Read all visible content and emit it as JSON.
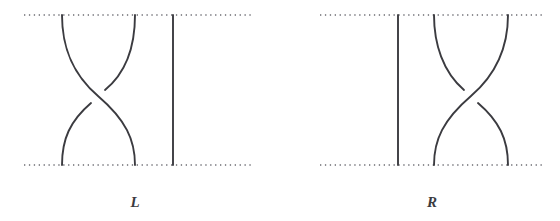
{
  "figure": {
    "kind": "braid-crossing-diagrams",
    "background_color": "#ffffff",
    "stroke_color": "#3b3b40",
    "dotted_line_color": "#6c6c72",
    "panels": [
      {
        "id": "left",
        "label": "L",
        "label_x": 135,
        "label_y": 205,
        "description": "Three-strand braid generator: strands 1 and 2 cross, strand 3 runs straight",
        "boundary_top_y": 15,
        "boundary_bottom_y": 165,
        "boundary_x_start": 24,
        "boundary_x_end": 252,
        "strand_top_anchors": [
          62,
          135,
          173
        ],
        "strand_bottom_anchors": [
          62,
          135,
          173
        ],
        "straight_strand_x": 173,
        "crossing_center_x": 98,
        "crossing_center_y": 96,
        "over_strand": "upper-left-to-lower-right",
        "under_strand": "upper-right-to-lower-left"
      },
      {
        "id": "right",
        "label": "R",
        "label_x": 432,
        "label_y": 205,
        "description": "Three-strand braid generator: strand 1 runs straight, strands 2 and 3 cross",
        "boundary_top_y": 15,
        "boundary_bottom_y": 165,
        "boundary_x_start": 320,
        "boundary_x_end": 544,
        "strand_top_anchors": [
          398,
          434,
          508
        ],
        "strand_bottom_anchors": [
          398,
          434,
          508
        ],
        "straight_strand_x": 398,
        "crossing_center_x": 471,
        "crossing_center_y": 96,
        "over_strand": "upper-right-to-lower-left",
        "under_strand": "upper-left-to-lower-right"
      }
    ]
  }
}
